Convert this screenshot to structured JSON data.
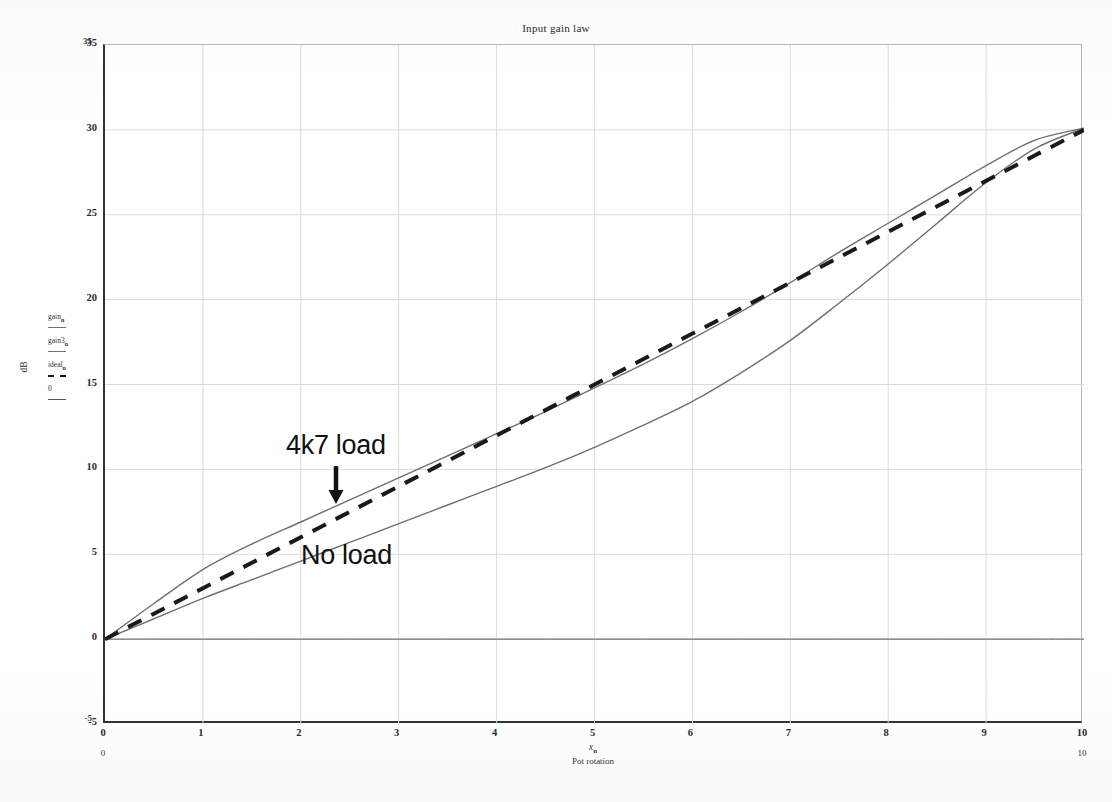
{
  "chart_data": {
    "type": "line",
    "title": "Input gain law",
    "xlabel_var": "x",
    "xlabel_sub": "n",
    "xlabel": "Pot rotation",
    "ylabel": "dB",
    "xlim": [
      0,
      10
    ],
    "ylim": [
      -5,
      35
    ],
    "xticks": [
      "0",
      "1",
      "2",
      "3",
      "4",
      "5",
      "6",
      "7",
      "8",
      "9",
      "10"
    ],
    "yticks": [
      "-5",
      "0",
      "5",
      "10",
      "15",
      "20",
      "25",
      "30",
      "35"
    ],
    "grid": true,
    "legend_position": "left-of-axis",
    "x": [
      0,
      0.5,
      1,
      1.5,
      2,
      2.5,
      3,
      3.5,
      4,
      4.5,
      5,
      5.5,
      6,
      6.5,
      7,
      7.5,
      8,
      8.5,
      9,
      9.5,
      10
    ],
    "series": [
      {
        "name": "gain",
        "label": "4k7 load",
        "style": "solid",
        "color": "#6f6f6f",
        "values": [
          0,
          2.1,
          4.1,
          5.6,
          6.9,
          8.2,
          9.5,
          10.8,
          12.1,
          13.4,
          14.8,
          16.2,
          17.7,
          19.3,
          21.0,
          22.8,
          24.5,
          26.2,
          27.9,
          29.4,
          30.1
        ]
      },
      {
        "name": "gain3",
        "label": "No load",
        "style": "solid",
        "color": "#6f6f6f",
        "values": [
          0,
          1.2,
          2.4,
          3.5,
          4.6,
          5.7,
          6.8,
          7.9,
          9.0,
          10.1,
          11.3,
          12.6,
          14.0,
          15.7,
          17.6,
          19.8,
          22.1,
          24.5,
          26.9,
          28.9,
          30.1
        ]
      },
      {
        "name": "ideal",
        "label": "ideal",
        "style": "dashed",
        "color": "#1a1a1a",
        "values": [
          0,
          1.5,
          3.0,
          4.5,
          6.0,
          7.5,
          9.0,
          10.5,
          12.0,
          13.5,
          15.0,
          16.5,
          18.0,
          19.5,
          21.0,
          22.5,
          24.0,
          25.5,
          27.0,
          28.5,
          30.0
        ]
      },
      {
        "name": "zero",
        "label": "0",
        "style": "solid-thin",
        "color": "#555555",
        "values": [
          0,
          0,
          0,
          0,
          0,
          0,
          0,
          0,
          0,
          0,
          0,
          0,
          0,
          0,
          0,
          0,
          0,
          0,
          0,
          0,
          0
        ]
      }
    ],
    "annotations": [
      {
        "text": "4k7 load",
        "x": 2.4,
        "y": 12.6,
        "arrow": "down"
      },
      {
        "text": "No load",
        "x": 2.6,
        "y": 6.5,
        "arrow": "none"
      }
    ]
  },
  "legend": {
    "entries": [
      {
        "base": "gain",
        "sub": "n",
        "style": "solid"
      },
      {
        "base": "gain3",
        "sub": "n",
        "style": "solid"
      },
      {
        "base": "ideal",
        "sub": "n",
        "style": "dashed"
      },
      {
        "base": "0",
        "sub": "",
        "style": "solid-thin"
      }
    ]
  },
  "axis_limits": {
    "y_max": "35",
    "y_min": "-5",
    "x_min": "0",
    "x_max": "10"
  },
  "colors": {
    "trace": "#6f6f6f",
    "ideal": "#1a1a1a",
    "grid": "#dcdcdc",
    "axis": "#333333",
    "background": "#ffffff"
  }
}
